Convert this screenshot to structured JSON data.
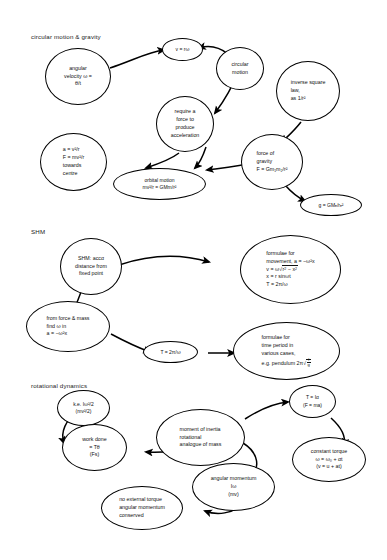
{
  "document": {
    "title": "Physics concept map: circular motion & gravity, SHM, rotational dynamics"
  },
  "sections": [
    {
      "id": "circular",
      "label": "circular motion & gravity"
    },
    {
      "id": "shm",
      "label": "SHM"
    },
    {
      "id": "rotational",
      "label": "rotational dynamics"
    }
  ],
  "nodes": {
    "angular_velocity": "angular\nvelocity ω =\nθ/t",
    "v_eq_r_omega": "v = rω",
    "circular_motion": "circular\nmotion",
    "require_force": "require a\nforce to\nproduce\nacceleration",
    "inverse_square": "inverse square\nlaw,\nas 1/r²",
    "centripetal": "a = v²/r\nF = mv²/r\ntowards\ncentre",
    "orbital_motion": "orbital motion\nmv²/r = GMm/r²",
    "force_of_gravity": "force of\ngravity\nF = Gm₁m₂/r²",
    "g_field": "g = GMₑ/rₑ²",
    "shm_definition": "SHM: accα\ndistance from\nfixed point",
    "shm_formulae_movement_l1": "formulae for",
    "shm_formulae_movement_l2": "movement, a = −ω²x",
    "shm_formulae_movement_l3": "v = ω√(r² − x²)",
    "shm_formulae_movement_l4": "x = r sinωt",
    "shm_formulae_movement_l5": "T = 2π/ω",
    "from_force_mass": "from force & mass\nfind ω in\na = −ω²x",
    "period_formula": "T = 2π/ω",
    "time_period_cases_l1": "formulae for",
    "time_period_cases_l2": "time period in",
    "time_period_cases_l3": "various cases,",
    "time_period_cases_l4": "e.g. pendulum 2π√(l/g)",
    "kinetic_energy": "k.e. Iω²/2\n(mv²/2)",
    "work_done": "work done\n= Tθ\n(Fs)",
    "moment_of_inertia": "moment of inertia\nrotational\nanalogue of mass",
    "torque_eq": "T = Iα\n(F = ma)",
    "constant_torque": "constant torque\nω = ω₀ + αt\n(v = u + at)",
    "angular_momentum": "angular momentum\nIω\n(mv)",
    "no_external_torque": "no external torque\nangular momentum\nconserved"
  },
  "style": {
    "ink": "#000000",
    "background": "#ffffff"
  }
}
